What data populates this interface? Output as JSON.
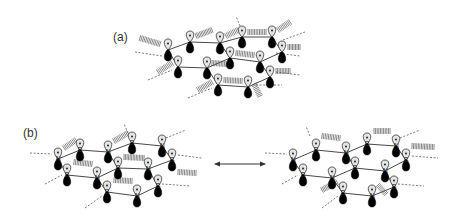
{
  "figure": {
    "width": 456,
    "height": 216,
    "colors": {
      "background": "#ffffff",
      "lobe_positive": "#e4e4e4",
      "lobe_negative": "#000000",
      "line": "#333333"
    }
  },
  "panels": [
    {
      "id": "a",
      "label": "(a)",
      "label_pos": [
        113,
        41
      ],
      "description": "Graphene-like sheet with p orbitals on each atom; no atom labels",
      "atoms": [
        {
          "x": 190,
          "y": 37,
          "el": ""
        },
        {
          "x": 220,
          "y": 38,
          "el": ""
        },
        {
          "x": 242,
          "y": 32,
          "el": ""
        },
        {
          "x": 272,
          "y": 32,
          "el": ""
        },
        {
          "x": 168,
          "y": 45,
          "el": ""
        },
        {
          "x": 230,
          "y": 53,
          "el": ""
        },
        {
          "x": 260,
          "y": 57,
          "el": ""
        },
        {
          "x": 282,
          "y": 47,
          "el": ""
        },
        {
          "x": 178,
          "y": 62,
          "el": ""
        },
        {
          "x": 207,
          "y": 63,
          "el": ""
        },
        {
          "x": 218,
          "y": 80,
          "el": ""
        },
        {
          "x": 248,
          "y": 82,
          "el": ""
        },
        {
          "x": 270,
          "y": 72,
          "el": ""
        }
      ],
      "bonds": [
        [
          4,
          0
        ],
        [
          0,
          1
        ],
        [
          1,
          2
        ],
        [
          2,
          3
        ],
        [
          4,
          8
        ],
        [
          8,
          9
        ],
        [
          9,
          5
        ],
        [
          5,
          1
        ],
        [
          5,
          6
        ],
        [
          6,
          7
        ],
        [
          7,
          3
        ],
        [
          6,
          12
        ],
        [
          12,
          11
        ],
        [
          11,
          10
        ],
        [
          10,
          9
        ]
      ],
      "dashes": [
        [
          135,
          52,
          162,
          56
        ],
        [
          148,
          80,
          172,
          70
        ],
        [
          188,
          98,
          212,
          88
        ],
        [
          276,
          53,
          300,
          56
        ],
        [
          276,
          72,
          300,
          75
        ],
        [
          256,
          85,
          282,
          85
        ],
        [
          283,
          40,
          305,
          32
        ],
        [
          240,
          26,
          236,
          16
        ]
      ],
      "hatches": [
        {
          "x1": 160,
          "y1": 44,
          "x2": 140,
          "y2": 38
        },
        {
          "x1": 196,
          "y1": 36,
          "x2": 212,
          "y2": 30
        },
        {
          "x1": 226,
          "y1": 36,
          "x2": 238,
          "y2": 30
        },
        {
          "x1": 248,
          "y1": 32,
          "x2": 266,
          "y2": 32
        },
        {
          "x1": 278,
          "y1": 30,
          "x2": 290,
          "y2": 22
        },
        {
          "x1": 288,
          "y1": 47,
          "x2": 300,
          "y2": 47
        },
        {
          "x1": 236,
          "y1": 53,
          "x2": 254,
          "y2": 55
        },
        {
          "x1": 212,
          "y1": 63,
          "x2": 226,
          "y2": 64
        },
        {
          "x1": 172,
          "y1": 63,
          "x2": 158,
          "y2": 72
        },
        {
          "x1": 224,
          "y1": 80,
          "x2": 242,
          "y2": 81
        },
        {
          "x1": 212,
          "y1": 82,
          "x2": 198,
          "y2": 90
        },
        {
          "x1": 254,
          "y1": 84,
          "x2": 260,
          "y2": 96
        },
        {
          "x1": 276,
          "y1": 71,
          "x2": 290,
          "y2": 71
        }
      ]
    },
    {
      "id": "b-left",
      "label": "(b)",
      "label_pos": [
        23,
        137
      ],
      "description": "Hexagonal BN sheet resonance structure 1",
      "atoms": [
        {
          "x": 58,
          "y": 154,
          "el": "N"
        },
        {
          "x": 80,
          "y": 145,
          "el": "B"
        },
        {
          "x": 108,
          "y": 147,
          "el": "N"
        },
        {
          "x": 132,
          "y": 138,
          "el": "B"
        },
        {
          "x": 162,
          "y": 141,
          "el": "N"
        },
        {
          "x": 172,
          "y": 155,
          "el": "B"
        },
        {
          "x": 148,
          "y": 164,
          "el": "N"
        },
        {
          "x": 118,
          "y": 163,
          "el": "B"
        },
        {
          "x": 97,
          "y": 173,
          "el": "N"
        },
        {
          "x": 67,
          "y": 170,
          "el": "B"
        },
        {
          "x": 107,
          "y": 187,
          "el": "B"
        },
        {
          "x": 137,
          "y": 191,
          "el": "N"
        },
        {
          "x": 158,
          "y": 181,
          "el": "B"
        }
      ],
      "bonds": [
        [
          0,
          1
        ],
        [
          1,
          2
        ],
        [
          2,
          3
        ],
        [
          3,
          4
        ],
        [
          4,
          5
        ],
        [
          5,
          6
        ],
        [
          6,
          7
        ],
        [
          7,
          2
        ],
        [
          0,
          9
        ],
        [
          9,
          8
        ],
        [
          8,
          7
        ],
        [
          8,
          10
        ],
        [
          10,
          11
        ],
        [
          11,
          12
        ],
        [
          12,
          6
        ]
      ],
      "dashes": [
        [
          30,
          153,
          52,
          154
        ],
        [
          45,
          184,
          62,
          175
        ],
        [
          85,
          208,
          102,
          196
        ],
        [
          166,
          138,
          186,
          130
        ],
        [
          178,
          155,
          202,
          158
        ],
        [
          162,
          184,
          190,
          186
        ],
        [
          128,
          133,
          124,
          124
        ]
      ],
      "hatches": [
        {
          "x1": 64,
          "y1": 148,
          "x2": 76,
          "y2": 140
        },
        {
          "x1": 114,
          "y1": 141,
          "x2": 128,
          "y2": 133
        },
        {
          "x1": 74,
          "y1": 162,
          "x2": 92,
          "y2": 164
        },
        {
          "x1": 124,
          "y1": 157,
          "x2": 144,
          "y2": 158
        },
        {
          "x1": 178,
          "y1": 172,
          "x2": 196,
          "y2": 173
        },
        {
          "x1": 114,
          "y1": 180,
          "x2": 132,
          "y2": 181
        }
      ]
    },
    {
      "id": "b-right",
      "label": "",
      "description": "Hexagonal BN sheet resonance structure 2",
      "atoms": [
        {
          "x": 293,
          "y": 155,
          "el": "N"
        },
        {
          "x": 316,
          "y": 145,
          "el": "B"
        },
        {
          "x": 346,
          "y": 148,
          "el": "N"
        },
        {
          "x": 367,
          "y": 139,
          "el": "B"
        },
        {
          "x": 396,
          "y": 141,
          "el": "N"
        },
        {
          "x": 406,
          "y": 155,
          "el": "B"
        },
        {
          "x": 385,
          "y": 166,
          "el": "N"
        },
        {
          "x": 355,
          "y": 163,
          "el": "B"
        },
        {
          "x": 332,
          "y": 173,
          "el": "N"
        },
        {
          "x": 303,
          "y": 170,
          "el": "B"
        },
        {
          "x": 343,
          "y": 188,
          "el": "B"
        },
        {
          "x": 372,
          "y": 191,
          "el": "N"
        },
        {
          "x": 394,
          "y": 182,
          "el": "B"
        }
      ],
      "bonds": [
        [
          0,
          1
        ],
        [
          1,
          2
        ],
        [
          2,
          3
        ],
        [
          3,
          4
        ],
        [
          4,
          5
        ],
        [
          5,
          6
        ],
        [
          6,
          7
        ],
        [
          7,
          2
        ],
        [
          0,
          9
        ],
        [
          9,
          8
        ],
        [
          8,
          7
        ],
        [
          8,
          10
        ],
        [
          10,
          11
        ],
        [
          11,
          12
        ],
        [
          12,
          6
        ]
      ],
      "dashes": [
        [
          265,
          153,
          287,
          154
        ],
        [
          282,
          184,
          298,
          175
        ],
        [
          322,
          208,
          338,
          196
        ],
        [
          400,
          138,
          420,
          130
        ],
        [
          412,
          156,
          438,
          158
        ],
        [
          398,
          184,
          424,
          186
        ],
        [
          310,
          136,
          306,
          126
        ]
      ],
      "hatches": [
        {
          "x1": 322,
          "y1": 136,
          "x2": 340,
          "y2": 138
        },
        {
          "x1": 374,
          "y1": 131,
          "x2": 390,
          "y2": 131
        },
        {
          "x1": 412,
          "y1": 146,
          "x2": 434,
          "y2": 147
        },
        {
          "x1": 337,
          "y1": 182,
          "x2": 322,
          "y2": 190
        },
        {
          "x1": 378,
          "y1": 185,
          "x2": 386,
          "y2": 194
        }
      ]
    }
  ],
  "resonance_arrow": {
    "x1": 212,
    "y1": 164,
    "x2": 268,
    "y2": 164,
    "type": "double-headed"
  }
}
